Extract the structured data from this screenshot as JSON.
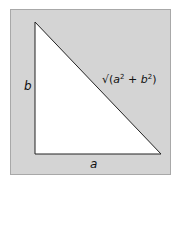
{
  "diagram": {
    "type": "right-triangle",
    "background_color": "#d4d4d4",
    "triangle_fill": "#ffffff",
    "stroke_color": "#222222",
    "labels": {
      "vertical_leg": "b",
      "horizontal_leg": "a",
      "hypotenuse": {
        "root": "√",
        "open": "(",
        "var1": "a",
        "exp1": "2",
        "plus": " + ",
        "var2": "b",
        "exp2": "2",
        "close": ")"
      }
    }
  }
}
